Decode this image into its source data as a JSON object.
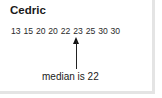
{
  "card": {
    "title": "Cedric",
    "numbers_text": "13 15 20 20 22 23 25 30 30",
    "numbers": [
      13,
      15,
      20,
      20,
      22,
      23,
      25,
      30,
      30
    ],
    "annotation": "median is 22",
    "median": 22
  }
}
